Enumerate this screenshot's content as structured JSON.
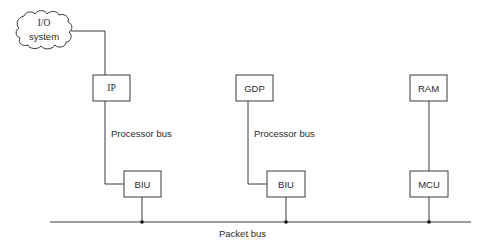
{
  "diagram": {
    "io_system": {
      "line1": "I/O",
      "line2": "system"
    },
    "nodes": {
      "ip": "IP",
      "gdp": "GDP",
      "ram": "RAM",
      "biu_left": "BIU",
      "biu_middle": "BIU",
      "mcu": "MCU"
    },
    "labels": {
      "processor_bus_left": "Processor bus",
      "processor_bus_middle": "Processor bus",
      "packet_bus": "Packet bus"
    },
    "colors": {
      "stroke": "#3a3a3a",
      "text": "#2a2a2a",
      "background": "#ffffff"
    }
  }
}
